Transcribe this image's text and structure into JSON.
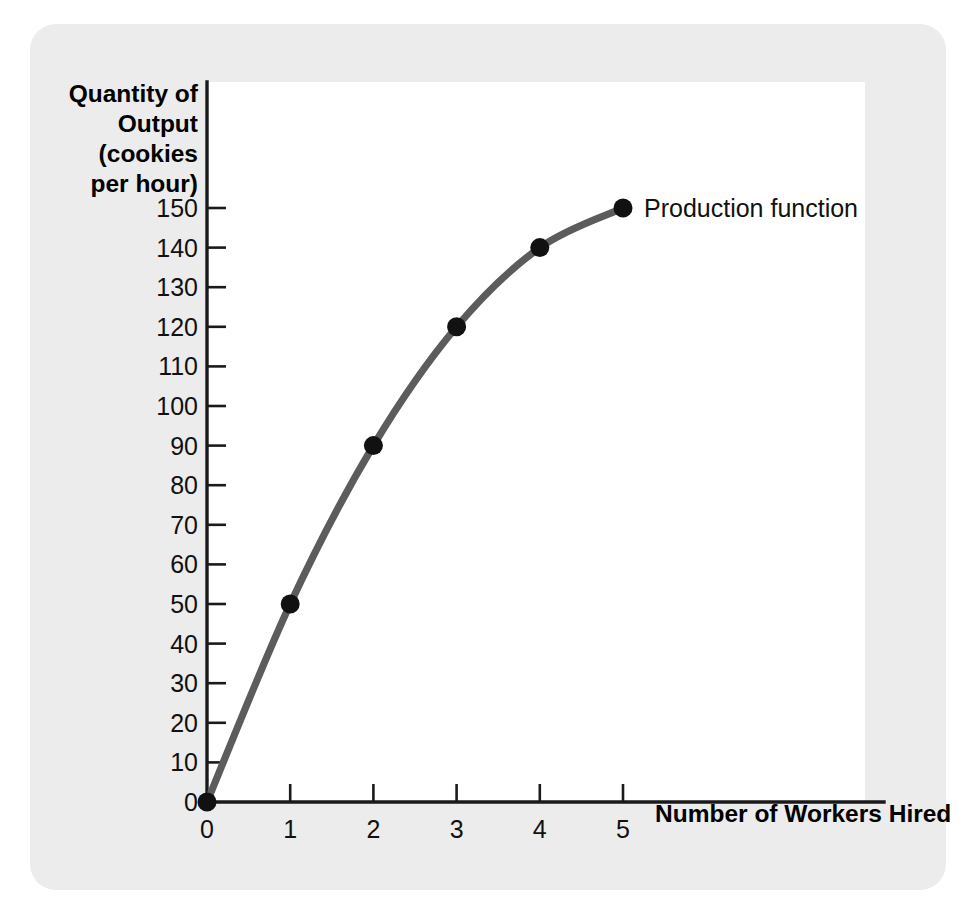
{
  "figure": {
    "panel_background": "#ececec",
    "plot_background": "#ffffff"
  },
  "chart_data": {
    "type": "line",
    "title": "",
    "subtitle": "",
    "xlabel": "Number of Workers Hired",
    "ylabel": "Quantity of Output (cookies per hour)",
    "ylabel_lines": [
      "Quantity of",
      "Output",
      "(cookies",
      "per hour)"
    ],
    "x": [
      0,
      1,
      2,
      3,
      4,
      5
    ],
    "values": [
      0,
      50,
      90,
      120,
      140,
      150
    ],
    "series": [
      {
        "name": "Production function",
        "x": [
          0,
          1,
          2,
          3,
          4,
          5
        ],
        "values": [
          0,
          50,
          90,
          120,
          140,
          150
        ],
        "line_color": "#5c5c5c",
        "marker_color": "#111111"
      }
    ],
    "xlim": [
      0,
      5
    ],
    "ylim": [
      0,
      155
    ],
    "xticks": [
      0,
      1,
      2,
      3,
      4,
      5
    ],
    "xtick_labels": [
      "0",
      "1",
      "2",
      "3",
      "4",
      "5"
    ],
    "yticks": [
      0,
      10,
      20,
      30,
      40,
      50,
      60,
      70,
      80,
      90,
      100,
      110,
      120,
      130,
      140,
      150
    ],
    "ytick_labels": [
      "0",
      "10",
      "20",
      "30",
      "40",
      "50",
      "60",
      "70",
      "80",
      "90",
      "100",
      "110",
      "120",
      "130",
      "140",
      "150"
    ],
    "grid": false,
    "legend": "none",
    "annotations": [
      {
        "text": "Production function",
        "anchor_x": 5,
        "anchor_y": 150
      }
    ]
  }
}
